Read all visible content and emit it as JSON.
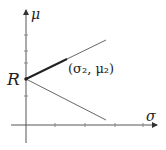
{
  "diagram": {
    "axes": {
      "y_label": "μ",
      "x_label": "σ"
    },
    "points": {
      "origin_label": "R",
      "point_label": "(σ₂, μ₂)"
    },
    "colors": {
      "line": "#333333",
      "thin_line": "#666666",
      "background": "#ffffff"
    }
  }
}
